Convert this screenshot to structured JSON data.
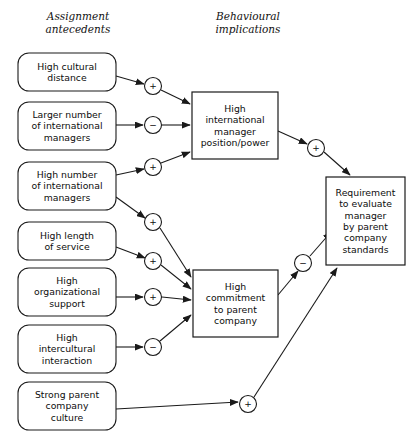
{
  "diagram": {
    "type": "causal-influence-diagram",
    "columns": [
      {
        "id": "antecedents",
        "title_line1": "Assignment",
        "title_line2": "antecedents",
        "x": 78,
        "y1": 20,
        "y2": 33
      },
      {
        "id": "implications",
        "title_line1": "Behavioural",
        "title_line2": "implications",
        "x": 248,
        "y1": 20,
        "y2": 33
      }
    ],
    "antecedent_boxes": [
      {
        "id": "high-cultural-distance",
        "lines": [
          "High cultural",
          "distance"
        ],
        "x": 18,
        "y": 53,
        "w": 98,
        "h": 38
      },
      {
        "id": "larger-number-international-managers",
        "lines": [
          "Larger number",
          "of international",
          "managers"
        ],
        "x": 18,
        "y": 102,
        "w": 98,
        "h": 48
      },
      {
        "id": "high-number-international-managers",
        "lines": [
          "High number",
          "of international",
          "managers"
        ],
        "x": 18,
        "y": 162,
        "w": 98,
        "h": 48
      },
      {
        "id": "high-length-of-service",
        "lines": [
          "High length",
          "of service"
        ],
        "x": 18,
        "y": 222,
        "w": 98,
        "h": 38
      },
      {
        "id": "high-organizational-support",
        "lines": [
          "High",
          "organizational",
          "support"
        ],
        "x": 18,
        "y": 268,
        "w": 98,
        "h": 48
      },
      {
        "id": "high-intercultural-interaction",
        "lines": [
          "High",
          "intercultural",
          "interaction"
        ],
        "x": 18,
        "y": 325,
        "w": 98,
        "h": 48
      },
      {
        "id": "strong-parent-company-culture",
        "lines": [
          "Strong parent",
          "company",
          "culture"
        ],
        "x": 18,
        "y": 382,
        "w": 98,
        "h": 48
      }
    ],
    "outcome_nodes": [
      {
        "id": "high-international-manager-position-power",
        "lines": [
          "High",
          "international",
          "manager",
          "position/power"
        ],
        "x": 192,
        "y": 92,
        "w": 86,
        "h": 67
      },
      {
        "id": "high-commitment-to-parent-company",
        "lines": [
          "High",
          "commitment",
          "to parent",
          "company"
        ],
        "x": 193,
        "y": 270,
        "w": 85,
        "h": 67
      },
      {
        "id": "requirement-to-evaluate-manager",
        "lines": [
          "Requirement",
          "to evaluate",
          "manager",
          "by parent",
          "company",
          "standards"
        ],
        "x": 326,
        "y": 177,
        "w": 79,
        "h": 88
      }
    ],
    "sign_nodes": [
      {
        "id": "sign-cultural-distance-to-position",
        "sign": "+",
        "cx": 153,
        "cy": 86,
        "r": 8.5
      },
      {
        "id": "sign-larger-number-to-position",
        "sign": "−",
        "cx": 153,
        "cy": 125,
        "r": 8.5
      },
      {
        "id": "sign-high-number-to-position",
        "sign": "+",
        "cx": 153,
        "cy": 167,
        "r": 8.5
      },
      {
        "id": "sign-high-number-to-commitment",
        "sign": "+",
        "cx": 153,
        "cy": 222,
        "r": 8.5
      },
      {
        "id": "sign-length-of-service-to-commitment",
        "sign": "+",
        "cx": 153,
        "cy": 261,
        "r": 8.5
      },
      {
        "id": "sign-organizational-support-to-commitment",
        "sign": "+",
        "cx": 153,
        "cy": 297,
        "r": 8.5
      },
      {
        "id": "sign-intercultural-interaction-to-commitment",
        "sign": "−",
        "cx": 153,
        "cy": 347,
        "r": 8.5
      },
      {
        "id": "sign-position-to-requirement",
        "sign": "+",
        "cx": 316,
        "cy": 148,
        "r": 8.5
      },
      {
        "id": "sign-commitment-to-requirement",
        "sign": "−",
        "cx": 303,
        "cy": 263,
        "r": 8.5
      },
      {
        "id": "sign-culture-to-requirement",
        "sign": "+",
        "cx": 248,
        "cy": 404,
        "r": 8.5
      }
    ],
    "edges": [
      {
        "id": "edge-cultural-distance-to-sign",
        "from": "high-cultural-distance",
        "to": "sign-cultural-distance-to-position",
        "sign": "+",
        "points": "116,76 144,84",
        "arrow": true
      },
      {
        "id": "edge-sign-to-position-1",
        "from": "sign-cultural-distance-to-position",
        "to": "high-international-manager-position-power",
        "points": "161,90 190,104",
        "arrow": true
      },
      {
        "id": "edge-larger-number-to-sign",
        "from": "larger-number-international-managers",
        "to": "sign-larger-number-to-position",
        "sign": "−",
        "points": "116,125 143,125",
        "arrow": true
      },
      {
        "id": "edge-sign-to-position-2",
        "from": "sign-larger-number-to-position",
        "to": "high-international-manager-position-power",
        "points": "162,125 190,125",
        "arrow": true
      },
      {
        "id": "edge-high-number-to-sign-pos",
        "from": "high-number-international-managers",
        "to": "sign-high-number-to-position",
        "sign": "+",
        "points": "116,175 144,169",
        "arrow": true
      },
      {
        "id": "edge-sign-to-position-3",
        "from": "sign-high-number-to-position",
        "to": "high-international-manager-position-power",
        "points": "161,163 190,152",
        "arrow": true
      },
      {
        "id": "edge-high-number-to-sign-commit",
        "from": "high-number-international-managers",
        "to": "sign-high-number-to-commitment",
        "sign": "+",
        "points": "116,197 145,218",
        "arrow": true
      },
      {
        "id": "edge-sign-to-commitment-1",
        "from": "sign-high-number-to-commitment",
        "to": "high-commitment-to-parent-company",
        "points": "160,228 191,277",
        "arrow": true
      },
      {
        "id": "edge-length-of-service-to-sign",
        "from": "high-length-of-service",
        "to": "sign-length-of-service-to-commitment",
        "sign": "+",
        "points": "116,247 145,258",
        "arrow": true
      },
      {
        "id": "edge-sign-to-commitment-2",
        "from": "sign-length-of-service-to-commitment",
        "to": "high-commitment-to-parent-company",
        "points": "161,265 191,289",
        "arrow": true
      },
      {
        "id": "edge-org-support-to-sign",
        "from": "high-organizational-support",
        "to": "sign-organizational-support-to-commitment",
        "sign": "+",
        "points": "116,297 143,297",
        "arrow": true
      },
      {
        "id": "edge-sign-to-commitment-3",
        "from": "sign-organizational-support-to-commitment",
        "to": "high-commitment-to-parent-company",
        "points": "162,297 191,300",
        "arrow": true
      },
      {
        "id": "edge-intercultural-to-sign",
        "from": "high-intercultural-interaction",
        "to": "sign-intercultural-interaction-to-commitment",
        "sign": "−",
        "points": "116,347 143,347",
        "arrow": true
      },
      {
        "id": "edge-sign-to-commitment-4",
        "from": "sign-intercultural-interaction-to-commitment",
        "to": "high-commitment-to-parent-company",
        "points": "160,341 191,315",
        "arrow": true
      },
      {
        "id": "edge-position-to-sign",
        "from": "high-international-manager-position-power",
        "to": "sign-position-to-requirement",
        "sign": "+",
        "points": "278,131 307,144",
        "arrow": true
      },
      {
        "id": "edge-sign-to-requirement-1",
        "from": "sign-position-to-requirement",
        "to": "requirement-to-evaluate-manager",
        "points": "324,152 350,175",
        "arrow": true
      },
      {
        "id": "edge-commitment-to-sign",
        "from": "high-commitment-to-parent-company",
        "to": "sign-commitment-to-requirement",
        "sign": "−",
        "points": "278,295 298,271",
        "arrow": true
      },
      {
        "id": "edge-sign-to-requirement-2",
        "from": "sign-commitment-to-requirement",
        "to": "requirement-to-evaluate-manager",
        "points": "310,256 331,232",
        "arrow": true
      },
      {
        "id": "edge-culture-to-sign",
        "from": "strong-parent-company-culture",
        "to": "sign-culture-to-requirement",
        "sign": "+",
        "points": "116,409 238,402",
        "arrow": true
      },
      {
        "id": "edge-sign-to-requirement-3",
        "from": "sign-culture-to-requirement",
        "to": "requirement-to-evaluate-manager",
        "points": "254,397 337,268",
        "arrow": true
      }
    ]
  },
  "colors": {
    "stroke": "#1a1a1a",
    "fill": "#ffffff",
    "text": "#0d0d0d",
    "background": "#ffffff"
  }
}
